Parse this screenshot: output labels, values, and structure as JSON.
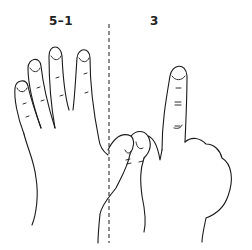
{
  "figure": {
    "panels": [
      {
        "id": "left",
        "label": "5–1",
        "description": "open right hand, four fingers extended, thumb folded"
      },
      {
        "id": "right",
        "label": "3",
        "description": "hand with index finger raised and thumb touching two fingers"
      }
    ],
    "divider": "dashed-vertical-line",
    "colors": {
      "ink": "#1a1a1a",
      "background": "#ffffff"
    }
  }
}
